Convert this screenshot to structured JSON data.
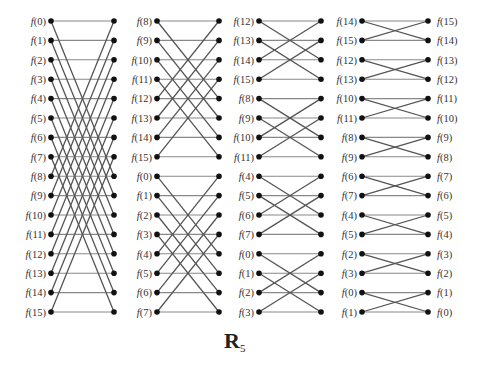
{
  "caption": {
    "main": "R",
    "sub": "5"
  },
  "rows": {
    "y0": 21,
    "dy": 19.4,
    "count": 16
  },
  "stages": [
    {
      "name": "stage-1",
      "left_x": 51,
      "right_x": 114,
      "label_x": 46,
      "right_label_x": 0,
      "left_labels": [
        "0",
        "1",
        "2",
        "3",
        "4",
        "5",
        "6",
        "7",
        "8",
        "9",
        "10",
        "11",
        "12",
        "13",
        "14",
        "15"
      ],
      "right_labels": [],
      "edges": [
        [
          0,
          0
        ],
        [
          1,
          1
        ],
        [
          2,
          2
        ],
        [
          3,
          3
        ],
        [
          4,
          4
        ],
        [
          5,
          5
        ],
        [
          6,
          6
        ],
        [
          7,
          7
        ],
        [
          8,
          8
        ],
        [
          9,
          9
        ],
        [
          10,
          10
        ],
        [
          11,
          11
        ],
        [
          12,
          12
        ],
        [
          13,
          13
        ],
        [
          14,
          14
        ],
        [
          15,
          15
        ],
        [
          0,
          8
        ],
        [
          1,
          9
        ],
        [
          2,
          10
        ],
        [
          3,
          11
        ],
        [
          4,
          12
        ],
        [
          5,
          13
        ],
        [
          6,
          14
        ],
        [
          7,
          15
        ],
        [
          8,
          0
        ],
        [
          9,
          1
        ],
        [
          10,
          2
        ],
        [
          11,
          3
        ],
        [
          12,
          4
        ],
        [
          13,
          5
        ],
        [
          14,
          6
        ],
        [
          15,
          7
        ]
      ]
    },
    {
      "name": "stage-2",
      "left_x": 157,
      "right_x": 219,
      "label_x": 152,
      "left_labels": [
        "8",
        "9",
        "10",
        "11",
        "12",
        "13",
        "14",
        "15",
        "0",
        "1",
        "2",
        "3",
        "4",
        "5",
        "6",
        "7"
      ],
      "right_labels": [],
      "edges": [
        [
          0,
          0
        ],
        [
          1,
          1
        ],
        [
          2,
          2
        ],
        [
          3,
          3
        ],
        [
          4,
          4
        ],
        [
          5,
          5
        ],
        [
          6,
          6
        ],
        [
          7,
          7
        ],
        [
          8,
          8
        ],
        [
          9,
          9
        ],
        [
          10,
          10
        ],
        [
          11,
          11
        ],
        [
          12,
          12
        ],
        [
          13,
          13
        ],
        [
          14,
          14
        ],
        [
          15,
          15
        ],
        [
          0,
          4
        ],
        [
          1,
          5
        ],
        [
          2,
          6
        ],
        [
          3,
          7
        ],
        [
          4,
          0
        ],
        [
          5,
          1
        ],
        [
          6,
          2
        ],
        [
          7,
          3
        ],
        [
          8,
          12
        ],
        [
          9,
          13
        ],
        [
          10,
          14
        ],
        [
          11,
          15
        ],
        [
          12,
          8
        ],
        [
          13,
          9
        ],
        [
          14,
          10
        ],
        [
          15,
          11
        ]
      ]
    },
    {
      "name": "stage-3",
      "left_x": 259,
      "right_x": 321,
      "label_x": 254,
      "left_labels": [
        "12",
        "13",
        "14",
        "15",
        "8",
        "9",
        "10",
        "11",
        "4",
        "5",
        "6",
        "7",
        "0",
        "1",
        "2",
        "3"
      ],
      "right_labels": [],
      "edges": [
        [
          0,
          0
        ],
        [
          1,
          1
        ],
        [
          2,
          2
        ],
        [
          3,
          3
        ],
        [
          4,
          4
        ],
        [
          5,
          5
        ],
        [
          6,
          6
        ],
        [
          7,
          7
        ],
        [
          8,
          8
        ],
        [
          9,
          9
        ],
        [
          10,
          10
        ],
        [
          11,
          11
        ],
        [
          12,
          12
        ],
        [
          13,
          13
        ],
        [
          14,
          14
        ],
        [
          15,
          15
        ],
        [
          0,
          2
        ],
        [
          1,
          3
        ],
        [
          2,
          0
        ],
        [
          3,
          1
        ],
        [
          4,
          6
        ],
        [
          5,
          7
        ],
        [
          6,
          4
        ],
        [
          7,
          5
        ],
        [
          8,
          10
        ],
        [
          9,
          11
        ],
        [
          10,
          8
        ],
        [
          11,
          9
        ],
        [
          12,
          14
        ],
        [
          13,
          15
        ],
        [
          14,
          12
        ],
        [
          15,
          13
        ]
      ]
    },
    {
      "name": "stage-4",
      "left_x": 362,
      "right_x": 428,
      "label_x": 357,
      "left_labels": [
        "14",
        "15",
        "12",
        "13",
        "10",
        "11",
        "8",
        "9",
        "6",
        "7",
        "4",
        "5",
        "2",
        "3",
        "0",
        "1"
      ],
      "right_labels": [
        "15",
        "14",
        "13",
        "12",
        "11",
        "10",
        "9",
        "8",
        "7",
        "6",
        "5",
        "4",
        "3",
        "2",
        "1",
        "0"
      ],
      "right_label_x": 437,
      "edges": [
        [
          0,
          0
        ],
        [
          1,
          1
        ],
        [
          2,
          2
        ],
        [
          3,
          3
        ],
        [
          4,
          4
        ],
        [
          5,
          5
        ],
        [
          6,
          6
        ],
        [
          7,
          7
        ],
        [
          8,
          8
        ],
        [
          9,
          9
        ],
        [
          10,
          10
        ],
        [
          11,
          11
        ],
        [
          12,
          12
        ],
        [
          13,
          13
        ],
        [
          14,
          14
        ],
        [
          15,
          15
        ],
        [
          0,
          1
        ],
        [
          1,
          0
        ],
        [
          2,
          3
        ],
        [
          3,
          2
        ],
        [
          4,
          5
        ],
        [
          5,
          4
        ],
        [
          6,
          7
        ],
        [
          7,
          6
        ],
        [
          8,
          9
        ],
        [
          9,
          8
        ],
        [
          10,
          11
        ],
        [
          11,
          10
        ],
        [
          12,
          13
        ],
        [
          13,
          12
        ],
        [
          14,
          15
        ],
        [
          15,
          14
        ]
      ]
    }
  ]
}
